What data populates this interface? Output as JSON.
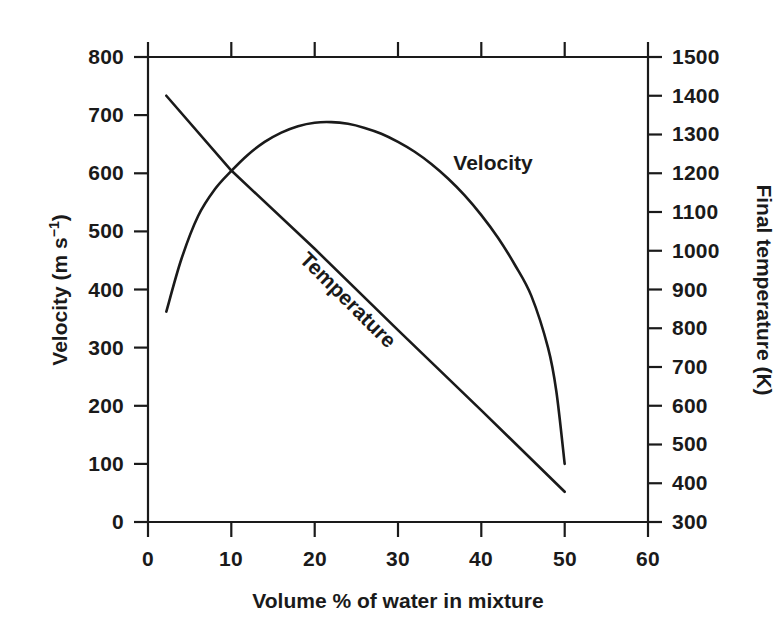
{
  "chart_data": {
    "type": "line",
    "title": "",
    "background_color": "#ffffff",
    "line_color": "#1a1a1a",
    "grid": false,
    "legend_position": "inline-curve-labels",
    "xlabel": "Volume % of water in mixture",
    "xticks": [
      "0",
      "10",
      "20",
      "30",
      "40",
      "50",
      "60"
    ],
    "xtick_values": [
      0,
      10,
      20,
      30,
      40,
      50,
      60
    ],
    "xlim": [
      0,
      60
    ],
    "left_axis": {
      "label_prefix": "Velocity (m s",
      "label_superscript": "−1",
      "label_suffix": ")",
      "label_full": "Velocity (m s⁻¹)",
      "ticks": [
        "800",
        "700",
        "600",
        "500",
        "400",
        "300",
        "200",
        "100",
        "0"
      ],
      "tick_values": [
        800,
        700,
        600,
        500,
        400,
        300,
        200,
        100,
        0
      ],
      "ylim": [
        0,
        800
      ]
    },
    "right_axis": {
      "label_full": "Final temperature (K)",
      "ticks": [
        "1500",
        "1400",
        "1300",
        "1200",
        "1100",
        "1000",
        "900",
        "800",
        "700",
        "600",
        "500",
        "400",
        "300"
      ],
      "tick_values": [
        1500,
        1400,
        1300,
        1200,
        1100,
        1000,
        900,
        800,
        700,
        600,
        500,
        400,
        300
      ],
      "ylim": [
        300,
        1500
      ]
    },
    "series": [
      {
        "name": "Velocity",
        "label": "Velocity",
        "axis": "left",
        "unit": "m s^-1",
        "x": [
          2.2,
          4,
          6,
          8,
          10,
          12,
          14,
          16,
          18,
          20,
          22,
          24,
          26,
          28,
          30,
          32,
          34,
          36,
          38,
          40,
          42,
          44,
          46,
          48,
          49,
          50
        ],
        "values": [
          362,
          452,
          526,
          572,
          604,
          632,
          654,
          670,
          681,
          687,
          688,
          685,
          678,
          668,
          654,
          637,
          616,
          591,
          562,
          528,
          489,
          443,
          389,
          300,
          225,
          100
        ]
      },
      {
        "name": "Temperature",
        "label": "Temperature",
        "axis": "right",
        "unit": "K",
        "x": [
          2.2,
          10,
          20,
          30,
          40,
          50
        ],
        "values_left_axis_equivalent": [
          733,
          605,
          470,
          330,
          192,
          52
        ],
        "values": [
          1400,
          1207,
          1005,
          795,
          588,
          378
        ]
      }
    ],
    "annotations": [
      {
        "text": "Velocity",
        "x": 33.5,
        "y_left_axis": 620
      },
      {
        "text": "Temperature",
        "x": 24.5,
        "y_left_axis": 430,
        "rotation_deg": 33
      }
    ]
  }
}
